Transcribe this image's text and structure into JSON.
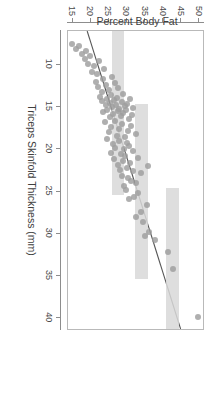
{
  "statusbar": {
    "clock": "5:27",
    "dots": "• • • • •",
    "signal_icon": "signal-icon",
    "wifi_icon": "wifi-icon",
    "battery_icon": "battery-icon"
  },
  "figure": {
    "rotation_degrees": 90,
    "background": "#ffffff",
    "frame_color": "#b9b9b9"
  },
  "chart_data": {
    "type": "scatter",
    "title": "",
    "xlabel": "Triceps Skinfold Thickness (mm)",
    "ylabel": "Percent Body Fat",
    "xlim": [
      6,
      41.5
    ],
    "ylim": [
      13.5,
      51.5
    ],
    "xticks": [
      10,
      15,
      20,
      25,
      30,
      35,
      40
    ],
    "yticks": [
      15,
      20,
      25,
      30,
      35,
      40,
      45,
      50
    ],
    "grid": false,
    "legend": null,
    "point_color": "#9e9e9e",
    "line_color": "#555555",
    "band_color": "#d8d8d8",
    "series": [
      {
        "name": "Observations",
        "marker": "filled-circle",
        "x": [
          39.9,
          34.2,
          32.1,
          30.7,
          30.2,
          29.8,
          28.6,
          28.0,
          27.4,
          26.6,
          25.9,
          25.6,
          25.2,
          24.8,
          24.4,
          24.0,
          23.7,
          23.4,
          23.1,
          22.8,
          22.6,
          22.4,
          22.2,
          22.0,
          21.8,
          21.6,
          21.4,
          21.2,
          21.0,
          20.8,
          20.6,
          20.4,
          20.2,
          20.0,
          19.8,
          19.6,
          19.4,
          19.2,
          19.0,
          18.8,
          18.6,
          18.4,
          18.2,
          18.0,
          17.8,
          17.6,
          17.4,
          17.2,
          17.0,
          16.8,
          16.6,
          16.4,
          16.2,
          16.0,
          15.9,
          15.8,
          15.7,
          15.6,
          15.5,
          15.4,
          15.3,
          15.2,
          15.1,
          15.0,
          14.9,
          14.8,
          14.7,
          14.6,
          14.5,
          14.4,
          14.3,
          14.2,
          14.1,
          14.0,
          13.9,
          13.8,
          13.6,
          13.4,
          13.2,
          13.0,
          12.8,
          12.6,
          12.4,
          12.2,
          12.0,
          11.7,
          11.4,
          11.1,
          10.8,
          10.5,
          10.2,
          9.9,
          9.6,
          9.3,
          9.0,
          8.7,
          8.4,
          8.1,
          7.8,
          7.5
        ],
        "y": [
          50.0,
          43.2,
          41.8,
          38.3,
          35.5,
          36.6,
          34.9,
          32.8,
          34.2,
          36.0,
          31.0,
          32.4,
          33.6,
          30.2,
          29.5,
          33.0,
          31.6,
          30.8,
          29.0,
          34.4,
          32.0,
          28.4,
          30.5,
          36.2,
          27.8,
          31.3,
          29.2,
          26.9,
          33.4,
          30.0,
          28.8,
          25.9,
          32.2,
          29.6,
          27.2,
          31.0,
          26.4,
          30.3,
          28.1,
          24.8,
          29.9,
          27.6,
          32.8,
          25.4,
          30.6,
          28.3,
          26.0,
          31.4,
          29.1,
          24.2,
          27.0,
          30.9,
          25.6,
          28.7,
          31.8,
          26.6,
          29.4,
          23.8,
          27.9,
          30.1,
          25.0,
          28.2,
          32.0,
          26.2,
          29.8,
          24.5,
          27.4,
          30.4,
          25.8,
          28.9,
          23.4,
          26.8,
          31.2,
          24.9,
          27.7,
          22.8,
          26.1,
          29.3,
          23.6,
          25.3,
          28.0,
          22.4,
          24.6,
          27.1,
          21.9,
          23.9,
          26.3,
          22.1,
          20.8,
          24.1,
          21.4,
          19.6,
          22.7,
          18.9,
          20.2,
          17.8,
          19.1,
          16.4,
          17.2,
          15.1
        ]
      }
    ],
    "fit_line": {
      "name": "Least-squares fit",
      "x1": 6.0,
      "y1": 18.9,
      "x2": 41.5,
      "y2": 45.2
    },
    "bands": [
      {
        "name": "reference-band-15",
        "x_center": 15.0,
        "x_half_width": 1.6,
        "y_low": 26.2,
        "y_high": 29.6
      },
      {
        "name": "reference-band-25",
        "x_center": 25.0,
        "x_half_width": 1.6,
        "y_low": 32.6,
        "y_high": 36.2
      },
      {
        "name": "reference-band-35",
        "x_center": 35.0,
        "x_half_width": 1.6,
        "y_low": 41.2,
        "y_high": 44.8
      }
    ]
  }
}
